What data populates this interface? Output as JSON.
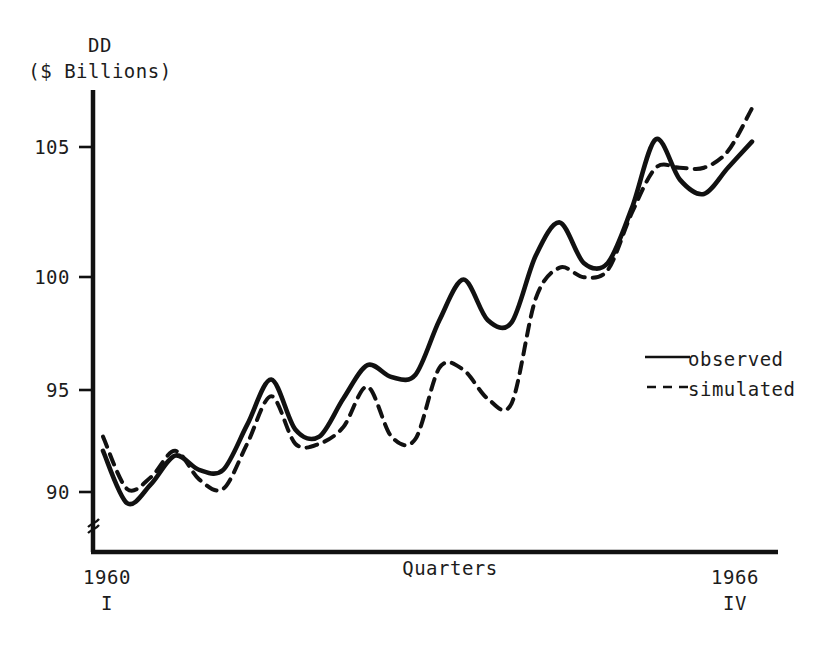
{
  "figure": {
    "width": 828,
    "height": 645,
    "background": "#ffffff",
    "ink_color": "#1a1a1a"
  },
  "axis": {
    "y_title_line1": "DD",
    "y_title_line2": "($ Billions)",
    "x_title": "Quarters",
    "x_start_year": "1960",
    "x_start_quarter": "I",
    "x_end_year": "1966",
    "x_end_quarter": "IV",
    "y_ticks": [
      "105",
      "100",
      "95",
      "90"
    ],
    "axis_break_symbol": "≈"
  },
  "legend": {
    "position": "right-middle",
    "entries": [
      {
        "label": "observed",
        "style": "solid",
        "icon": "solid-line-icon"
      },
      {
        "label": "simulated",
        "style": "dashed",
        "icon": "dashed-line-icon"
      }
    ]
  },
  "chart_data": {
    "type": "line",
    "title": "",
    "subtitle": "",
    "xlabel": "Quarters",
    "ylabel": "DD ($ Billions)",
    "ylim": [
      88.0,
      107.0
    ],
    "yticks": [
      90,
      95,
      100,
      105
    ],
    "grid": false,
    "axis_break_on_y": true,
    "legend_position": "right-middle",
    "x_range_label": "1960 I to 1966 IV",
    "x": [
      "1960 I",
      "1960 II",
      "1960 III",
      "1960 IV",
      "1961 I",
      "1961 II",
      "1961 III",
      "1961 IV",
      "1962 I",
      "1962 II",
      "1962 III",
      "1962 IV",
      "1963 I",
      "1963 II",
      "1963 III",
      "1963 IV",
      "1964 I",
      "1964 II",
      "1964 III",
      "1964 IV",
      "1965 I",
      "1965 II",
      "1965 III",
      "1965 IV",
      "1966 I",
      "1966 II",
      "1966 III",
      "1966 IV"
    ],
    "series": [
      {
        "name": "observed",
        "style": "solid",
        "values": [
          92.0,
          89.8,
          90.6,
          91.8,
          91.2,
          91.2,
          93.1,
          95.0,
          92.9,
          92.6,
          94.2,
          95.6,
          95.1,
          95.2,
          97.5,
          99.2,
          97.5,
          97.4,
          100.2,
          101.6,
          99.9,
          99.9,
          102.2,
          105.1,
          103.4,
          102.8,
          103.9,
          105.0
        ]
      },
      {
        "name": "simulated",
        "style": "dashed",
        "values": [
          92.6,
          90.4,
          90.9,
          92.0,
          90.8,
          90.4,
          92.3,
          94.3,
          92.3,
          92.3,
          93.0,
          94.7,
          92.6,
          92.5,
          95.5,
          95.4,
          94.2,
          94.0,
          98.4,
          99.7,
          99.3,
          99.6,
          102.0,
          103.9,
          103.9,
          103.9,
          104.6,
          106.4
        ]
      }
    ]
  }
}
